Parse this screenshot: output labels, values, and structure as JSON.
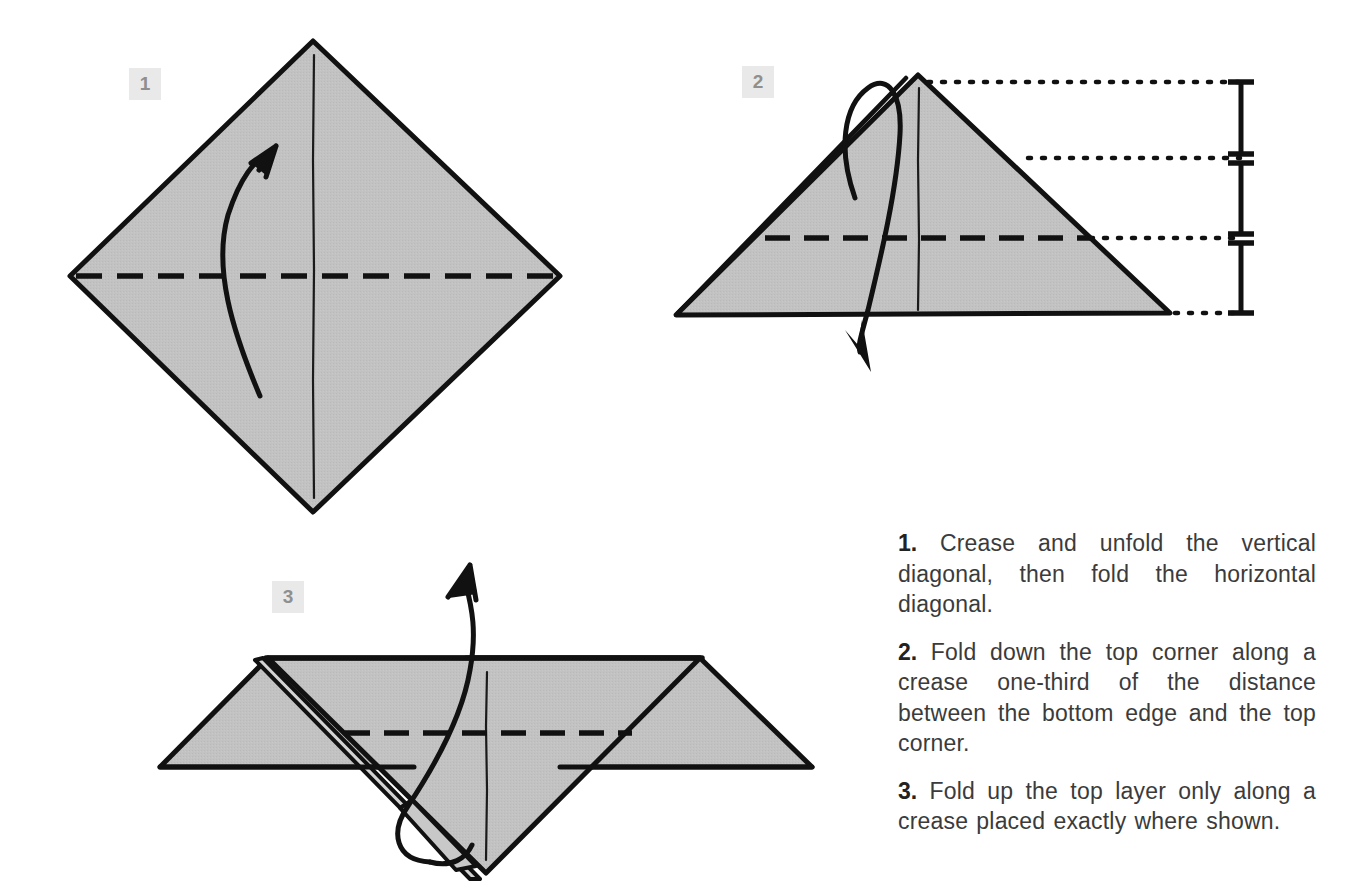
{
  "document": {
    "kind": "origami-folding-diagram",
    "background_color": "#ffffff",
    "paper_fill_color": "#bfbfbf",
    "line_color": "#111111",
    "badge_background_color": "#e9e9e9",
    "badge_text_color": "#8f8f8f",
    "text_color": "#3b3b3b"
  },
  "steps": [
    {
      "number": "1",
      "badge_label": "1",
      "diagram_name": "diamond-square-with-creases",
      "shape": "diamond",
      "crease_lines": [
        {
          "name": "vertical-diagonal-crease",
          "style": "thin-solid",
          "orientation": "vertical"
        },
        {
          "name": "horizontal-diagonal-fold",
          "style": "bold-dashed",
          "orientation": "horizontal"
        }
      ],
      "arrow": {
        "name": "valley-fold-arrow",
        "direction": "up-right",
        "style": "curved-open-head"
      }
    },
    {
      "number": "2",
      "badge_label": "2",
      "diagram_name": "folded-triangle-with-thirds-measure",
      "shape": "triangle",
      "crease_lines": [
        {
          "name": "vertical-center-crease",
          "style": "thin-solid",
          "orientation": "vertical"
        },
        {
          "name": "one-third-fold-line",
          "style": "bold-dashed",
          "orientation": "horizontal"
        }
      ],
      "arrow": {
        "name": "fold-down-arrow",
        "direction": "down-over-top",
        "style": "curved-filled-head"
      },
      "measurement": {
        "name": "thirds-measurement-bracket",
        "divisions": 3,
        "guide_lines": [
          "top-corner",
          "one-third",
          "two-thirds",
          "bottom-edge"
        ],
        "guide_style": "dotted"
      }
    },
    {
      "number": "3",
      "badge_label": "3",
      "diagram_name": "winged-form-with-top-layer-fold",
      "shape": "winged-v-form",
      "crease_lines": [
        {
          "name": "vertical-center-crease",
          "style": "thin-solid",
          "orientation": "vertical"
        },
        {
          "name": "top-layer-fold-line",
          "style": "bold-dashed",
          "orientation": "horizontal"
        }
      ],
      "arrow": {
        "name": "fold-up-arrow",
        "direction": "up-right",
        "style": "curved-open-head"
      }
    }
  ],
  "instructions": {
    "items": [
      {
        "number": "1.",
        "text": "Crease and unfold the vertical diagonal, then fold the horizontal diagonal."
      },
      {
        "number": "2.",
        "text": "Fold down the top corner along a crease one-third of the distance between the bottom edge and the top corner."
      },
      {
        "number": "3.",
        "text": "Fold up the top layer only along a crease placed exactly where shown."
      }
    ]
  }
}
